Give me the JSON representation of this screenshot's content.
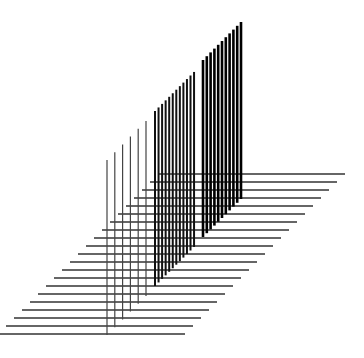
{
  "artwork": {
    "background": "#ffffff",
    "line_color": "#111111",
    "horizontal_lines": {
      "count": 21,
      "first_y": 174,
      "step": 8,
      "first_left_x": 158,
      "first_right_x": 345,
      "shift_per_row": 8,
      "stroke_width": 1.3,
      "color": "#333333"
    },
    "vertical_groups": [
      {
        "name": "thin",
        "x_start": 107,
        "count": 6,
        "step": 7.8,
        "stroke_width": 1.2,
        "top_offset": 267,
        "bottom_offset": 442,
        "color": "#444444"
      },
      {
        "name": "medium",
        "x_start": 155,
        "count": 12,
        "step": 3.55,
        "stroke_width": 2.0,
        "top_offset": 266,
        "bottom_offset": 441,
        "color": "#111111"
      },
      {
        "name": "thick",
        "x_start": 203,
        "count": 11,
        "step": 3.8,
        "stroke_width": 2.6,
        "top_offset": 263,
        "bottom_offset": 440,
        "color": "#000000"
      }
    ]
  }
}
